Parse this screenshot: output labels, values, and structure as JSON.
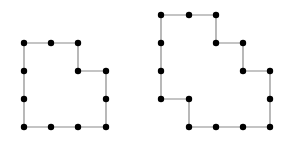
{
  "diagram": {
    "colors": {
      "line": "#8a8a8a",
      "dot": "#000000",
      "background": "#ffffff"
    },
    "shapes": [
      {
        "name": "left-polygon",
        "vertices": [
          [
            24,
            43
          ],
          [
            51,
            43
          ],
          [
            78,
            43
          ],
          [
            78,
            71
          ],
          [
            106,
            71
          ],
          [
            106,
            99
          ],
          [
            106,
            127
          ],
          [
            78,
            127
          ],
          [
            51,
            127
          ],
          [
            24,
            127
          ],
          [
            24,
            99
          ],
          [
            24,
            71
          ]
        ]
      },
      {
        "name": "right-polygon",
        "vertices": [
          [
            161,
            15
          ],
          [
            189,
            15
          ],
          [
            216,
            15
          ],
          [
            216,
            43
          ],
          [
            243,
            43
          ],
          [
            243,
            71
          ],
          [
            270,
            71
          ],
          [
            270,
            99
          ],
          [
            270,
            127
          ],
          [
            243,
            127
          ],
          [
            216,
            127
          ],
          [
            189,
            127
          ],
          [
            189,
            99
          ],
          [
            161,
            99
          ],
          [
            161,
            71
          ],
          [
            161,
            43
          ]
        ]
      }
    ]
  }
}
